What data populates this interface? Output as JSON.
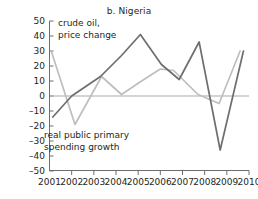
{
  "chart_data": {
    "type": "line",
    "title": "b. Nigeria",
    "xlabel": "",
    "ylabel": "",
    "xlim": [
      2001,
      2010
    ],
    "ylim": [
      -50,
      50
    ],
    "ytick_values": [
      50,
      40,
      30,
      20,
      10,
      0,
      -10,
      -20,
      -30,
      -40,
      -50
    ],
    "ytick_labels": [
      "50",
      "40",
      "30",
      "20",
      "10",
      "0",
      "–10",
      "–20",
      "–30",
      "–40",
      "–50"
    ],
    "xtick_labels": [
      "2001",
      "2002",
      "2003",
      "2004",
      "2005",
      "2006",
      "2007",
      "2008",
      "2009",
      "2010"
    ],
    "xtick_values": [
      2001,
      2002,
      2003,
      2004,
      2005,
      2006,
      2007,
      2008,
      2009,
      2010
    ],
    "grid": false,
    "zero_line": true,
    "legend_position": "inline-annotations",
    "series": [
      {
        "name": "crude oil, price change",
        "color": "#6d6e71",
        "x": [
          2001.15,
          2002.0,
          2003.3,
          2004.25,
          2005.1,
          2006.05,
          2006.85,
          2007.75,
          2008.7,
          2009.75
        ],
        "values": [
          -14,
          0,
          13,
          27,
          41,
          21,
          11,
          36,
          -36,
          30
        ]
      },
      {
        "name": "real public primary spending growth",
        "color": "#bcbec0",
        "x": [
          2001.1,
          2002.15,
          2003.35,
          2004.25,
          2005.05,
          2006.0,
          2006.6,
          2007.7,
          2008.65,
          2009.6
        ],
        "values": [
          29,
          -19,
          13,
          1,
          9,
          18,
          17,
          1,
          -5,
          30
        ]
      }
    ],
    "annotations": [
      {
        "name": "crude-oil-label",
        "lines": [
          "crude oil,",
          "price change"
        ],
        "x_px": 58,
        "y_px": 26
      },
      {
        "name": "spending-growth-label",
        "lines": [
          "real public primary",
          "spending growth"
        ],
        "x_px": 44,
        "y_px": 138
      }
    ]
  },
  "colors": {
    "crude_oil_line": "#6d6e71",
    "spending_line": "#bcbec0",
    "axis": "#6d6e71",
    "zero_line": "#a7a9ac",
    "text": "#231f20",
    "background": "#ffffff"
  }
}
